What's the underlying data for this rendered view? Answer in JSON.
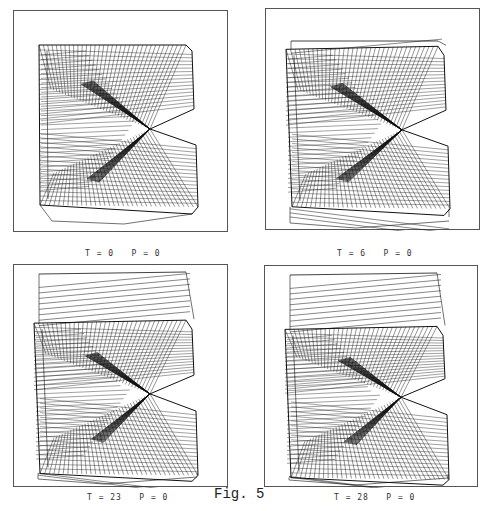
{
  "figure": {
    "label": "Fig. 5",
    "panels": [
      {
        "id": "p1",
        "caption": "T = 0   P = 0",
        "frame": {
          "x": 13,
          "y": 10,
          "w": 215,
          "h": 222
        },
        "offset": {
          "x": 0,
          "y": 0
        },
        "shift": 0
      },
      {
        "id": "p2",
        "caption": "T = 6   P = 0",
        "frame": {
          "x": 265,
          "y": 8,
          "w": 215,
          "h": 222
        },
        "offset": {
          "x": 0,
          "y": 0
        },
        "shift": 6
      },
      {
        "id": "p3",
        "caption": "T = 23   P = 0",
        "frame": {
          "x": 13,
          "y": 264,
          "w": 215,
          "h": 223
        },
        "offset": {
          "x": 0,
          "y": 0
        },
        "shift": 23
      },
      {
        "id": "p4",
        "caption": "T = 28   P = 0",
        "frame": {
          "x": 264,
          "y": 265,
          "w": 214,
          "h": 222
        },
        "offset": {
          "x": 0,
          "y": 0
        },
        "shift": 28
      }
    ],
    "caption_positions": [
      {
        "x": 85,
        "y": 249
      },
      {
        "x": 337,
        "y": 249
      },
      {
        "x": 87,
        "y": 493
      },
      {
        "x": 334,
        "y": 493
      }
    ],
    "fig_label_position": {
      "x": 214,
      "y": 486
    },
    "colors": {
      "line": "#111111",
      "frame": "#555555",
      "caption": "#333333"
    }
  }
}
